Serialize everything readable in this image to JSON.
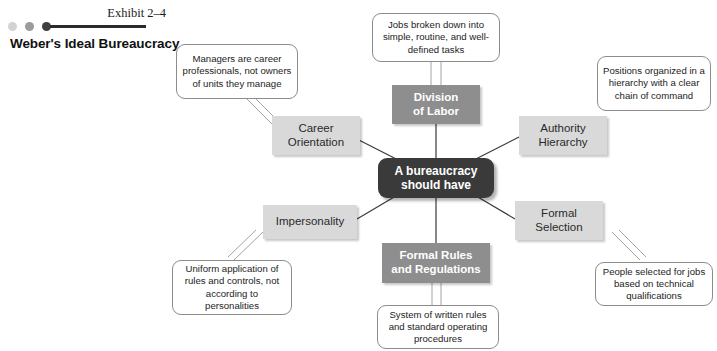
{
  "header": {
    "exhibit_label": "Exhibit 2–4",
    "title": "Weber's Ideal Bureaucracy",
    "dots": [
      "#d2d2d2",
      "#9b9b9b",
      "#3f3f3f"
    ],
    "rule_color": "#2b2b2b"
  },
  "colors": {
    "hub_bg": "#3a3a3a",
    "hub_text": "#ffffff",
    "node_dark_bg": "#8e8e8e",
    "node_dark_text": "#ffffff",
    "node_light_bg": "#d9d9d9",
    "node_light_text": "#2a2a2a",
    "callout_bg": "#ffffff",
    "callout_border": "#8c8c8c",
    "connector": "#3a3a3a",
    "tail": "#9a9a9a"
  },
  "diagram": {
    "hub": {
      "line1": "A bureaucracy",
      "line2": "should have"
    },
    "nodes": [
      {
        "id": "division-of-labor",
        "line1": "Division",
        "line2": "of Labor",
        "style": "dark"
      },
      {
        "id": "authority-hierarchy",
        "line1": "Authority",
        "line2": "Hierarchy",
        "style": "light"
      },
      {
        "id": "formal-selection",
        "line1": "Formal",
        "line2": "Selection",
        "style": "light"
      },
      {
        "id": "formal-rules",
        "line1": "Formal Rules",
        "line2": "and Regulations",
        "style": "dark"
      },
      {
        "id": "impersonality",
        "line1": "Impersonality",
        "line2": "",
        "style": "light"
      },
      {
        "id": "career-orientation",
        "line1": "Career",
        "line2": "Orientation",
        "style": "light"
      }
    ],
    "callouts": [
      {
        "id": "callout-division-of-labor",
        "lines": [
          "Jobs broken down",
          "into simple, routine,",
          "and well-defined tasks"
        ]
      },
      {
        "id": "callout-authority-hierarchy",
        "lines": [
          "Positions organized",
          "in a hierarchy with",
          "a clear chain",
          "of command"
        ]
      },
      {
        "id": "callout-formal-selection",
        "lines": [
          "People selected for",
          "jobs based on",
          "technical qualifications"
        ]
      },
      {
        "id": "callout-formal-rules",
        "lines": [
          "System of written",
          "rules and standard",
          "operating procedures"
        ]
      },
      {
        "id": "callout-impersonality",
        "lines": [
          "Uniform application",
          "of rules and controls,",
          "not according to",
          "personalities"
        ]
      },
      {
        "id": "callout-career-orientation",
        "lines": [
          "Managers are career",
          "professionals, not",
          "owners of units they",
          "manage"
        ]
      }
    ]
  }
}
